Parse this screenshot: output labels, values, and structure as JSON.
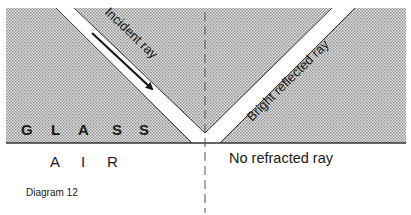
{
  "diagram": {
    "caption": "Diagram 12",
    "media": {
      "upper": [
        "G",
        "L",
        "A",
        "S",
        "S"
      ],
      "lower": [
        "A",
        "I",
        "R"
      ]
    },
    "rays": {
      "incident_label": "Incident ray",
      "reflected_label": "Bright reflected ray",
      "refracted_label": "No refracted ray"
    },
    "colors": {
      "glass_fill": "#c8c8c8",
      "ray_band": "#ffffff",
      "ink": "#1a1a1a",
      "normal_line": "#555555"
    }
  }
}
